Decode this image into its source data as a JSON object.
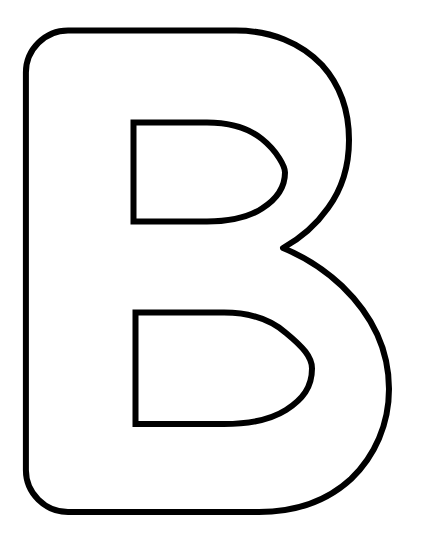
{
  "document": {
    "title": "Letter B Outline Coloring Page",
    "kind": "line-art",
    "character": "B",
    "canvas": {
      "width": 421,
      "height": 545,
      "background_color": "#ffffff"
    }
  },
  "artwork": {
    "name": "uppercase-letter-b-outline",
    "description": "Bubble-style uppercase letter B rendered as a black outline on a white background",
    "stroke_color": "#000000",
    "fill_color": "#ffffff",
    "stroke_width": 6,
    "geometry": {
      "outer_left_x": 25,
      "outer_top_y": 30,
      "outer_bottom_y": 511,
      "upper_bowl_right_x": 345,
      "lower_bowl_right_x": 387,
      "waist_x": 283,
      "waist_y": 250,
      "corner_radius": 42,
      "upper_counter": {
        "left": 133,
        "top": 122,
        "right": 245,
        "bottom": 221
      },
      "lower_counter": {
        "left": 135,
        "top": 312,
        "right": 282,
        "bottom": 424
      }
    },
    "paths": {
      "outer": "M 67 30 L 240 30 C 300 30 345 80 345 140 C 345 195 320 232 283 250 C 330 268 387 310 387 380 C 387 455 330 511 252 511 L 67 511 C 44 511 25 492 25 469 L 25 72 C 25 49 44 30 67 30 Z",
      "upper_counter": "M 133 122 L 212 122 C 255 122 286 150 286 172 C 286 196 255 221 212 221 L 133 221 Z",
      "lower_counter": "M 135 312 L 228 312 C 276 312 312 342 312 368 C 312 396 276 424 228 424 L 135 424 Z"
    }
  }
}
